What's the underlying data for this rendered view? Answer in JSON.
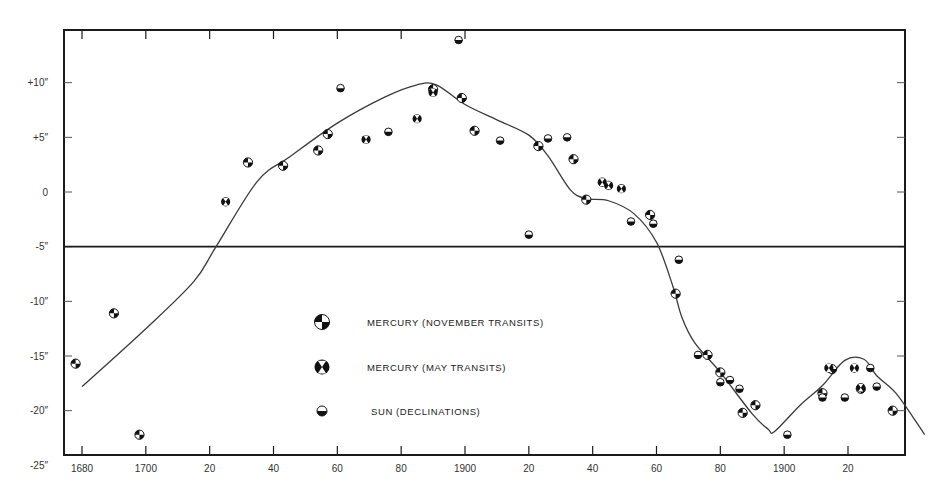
{
  "chart_data": {
    "type": "scatter",
    "title": "",
    "xlabel": "",
    "ylabel": "",
    "xlim": [
      1674,
      1939
    ],
    "ylim": [
      -25,
      14.5
    ],
    "grid": false,
    "legend_position": "inside-center-left",
    "x_ticks": [
      {
        "value": 1680,
        "label": "1680"
      },
      {
        "value": 1700,
        "label": "1700"
      },
      {
        "value": 1720,
        "label": "20"
      },
      {
        "value": 1740,
        "label": "40"
      },
      {
        "value": 1760,
        "label": "60"
      },
      {
        "value": 1780,
        "label": "80"
      },
      {
        "value": 1800,
        "label": "1900"
      },
      {
        "value": 1820,
        "label": "20"
      },
      {
        "value": 1840,
        "label": "40"
      },
      {
        "value": 1860,
        "label": "60"
      },
      {
        "value": 1880,
        "label": "80"
      },
      {
        "value": 1900,
        "label": "1900"
      },
      {
        "value": 1920,
        "label": "20"
      }
    ],
    "y_ticks": [
      {
        "value": 10,
        "label": "+10″"
      },
      {
        "value": 5,
        "label": "+5″"
      },
      {
        "value": 0,
        "label": "0"
      },
      {
        "value": -5,
        "label": "-5″"
      },
      {
        "value": -10,
        "label": "-10″"
      },
      {
        "value": -15,
        "label": "-15″"
      },
      {
        "value": -20,
        "label": "-20″"
      },
      {
        "value": -25,
        "label": "-25″"
      }
    ],
    "reference_line": {
      "y": -5.0
    },
    "series": [
      {
        "name": "MERCURY (NOVEMBER TRANSITS)",
        "marker": "quartered-circle",
        "points": [
          [
            1678,
            -15.7
          ],
          [
            1690,
            -11.1
          ],
          [
            1698,
            -22.2
          ],
          [
            1732,
            2.7
          ],
          [
            1743,
            2.4
          ],
          [
            1754,
            3.8
          ],
          [
            1757,
            5.3
          ],
          [
            1790,
            9.4
          ],
          [
            1799,
            8.6
          ],
          [
            1803,
            5.6
          ],
          [
            1823,
            4.2
          ],
          [
            1834,
            3.0
          ],
          [
            1838,
            -0.7
          ],
          [
            1858,
            -2.1
          ],
          [
            1866,
            -9.3
          ],
          [
            1876,
            -14.9
          ],
          [
            1880,
            -16.5
          ],
          [
            1887,
            -20.2
          ],
          [
            1891,
            -19.5
          ],
          [
            1912,
            -18.4
          ],
          [
            1915,
            -16.2
          ],
          [
            1924,
            -18.0
          ],
          [
            1934,
            -20.0
          ]
        ]
      },
      {
        "name": "MERCURY (MAY TRANSITS)",
        "marker": "x-circle",
        "points": [
          [
            1725,
            -0.9
          ],
          [
            1769,
            4.8
          ],
          [
            1785,
            6.7
          ],
          [
            1790,
            9.1
          ],
          [
            1843,
            0.9
          ],
          [
            1845,
            0.6
          ],
          [
            1849,
            0.3
          ],
          [
            1914,
            -16.1
          ],
          [
            1922,
            -16.1
          ],
          [
            1924,
            -17.9
          ]
        ]
      },
      {
        "name": "SUN (DECLINATIONS)",
        "marker": "half-filled-circle",
        "points": [
          [
            1761,
            9.5
          ],
          [
            1776,
            5.5
          ],
          [
            1798,
            13.9
          ],
          [
            1811,
            4.7
          ],
          [
            1820,
            -3.9
          ],
          [
            1826,
            4.9
          ],
          [
            1832,
            5.0
          ],
          [
            1852,
            -2.7
          ],
          [
            1859,
            -2.9
          ],
          [
            1867,
            -6.2
          ],
          [
            1873,
            -14.9
          ],
          [
            1880,
            -17.4
          ],
          [
            1883,
            -17.2
          ],
          [
            1886,
            -18.0
          ],
          [
            1901,
            -22.2
          ],
          [
            1912,
            -18.8
          ],
          [
            1919,
            -18.8
          ],
          [
            1927,
            -16.1
          ],
          [
            1929,
            -17.8
          ]
        ]
      }
    ],
    "curve": {
      "name": "smoothed fit",
      "points": [
        [
          1680,
          -17.8
        ],
        [
          1700,
          -12.5
        ],
        [
          1715,
          -8.2
        ],
        [
          1722,
          -5.0
        ],
        [
          1735,
          1.0
        ],
        [
          1745,
          3.2
        ],
        [
          1760,
          6.3
        ],
        [
          1775,
          8.7
        ],
        [
          1785,
          9.8
        ],
        [
          1791,
          9.8
        ],
        [
          1800,
          8.0
        ],
        [
          1810,
          6.6
        ],
        [
          1820,
          5.2
        ],
        [
          1826,
          3.3
        ],
        [
          1833,
          0.2
        ],
        [
          1838,
          -0.6
        ],
        [
          1845,
          -0.8
        ],
        [
          1853,
          -2.0
        ],
        [
          1860,
          -4.6
        ],
        [
          1865,
          -8.5
        ],
        [
          1868,
          -11.5
        ],
        [
          1872,
          -13.8
        ],
        [
          1880,
          -16.5
        ],
        [
          1890,
          -20.3
        ],
        [
          1895,
          -21.7
        ],
        [
          1897,
          -21.9
        ],
        [
          1905,
          -19.5
        ],
        [
          1912,
          -17.7
        ],
        [
          1919,
          -15.4
        ],
        [
          1925,
          -15.3
        ],
        [
          1929,
          -16.8
        ],
        [
          1935,
          -18.4
        ],
        [
          1942,
          -21.3
        ],
        [
          1944,
          -22.2
        ]
      ]
    },
    "legend": [
      {
        "marker": "quartered-circle",
        "label": "MERCURY (NOVEMBER TRANSITS)"
      },
      {
        "marker": "x-circle",
        "label": "MERCURY (MAY TRANSITS)"
      },
      {
        "marker": "half-filled-circle",
        "label": "SUN (DECLINATIONS)"
      }
    ]
  },
  "colors": {
    "axis": "#1a1a1a",
    "curve": "#3a3a3a",
    "marker": "#111111",
    "background": "#ffffff"
  }
}
